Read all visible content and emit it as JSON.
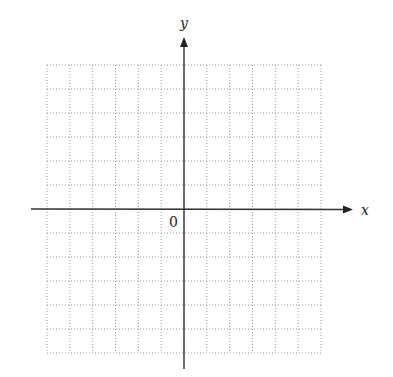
{
  "diagram": {
    "type": "coordinate-plane",
    "axes": {
      "x_label": "x",
      "y_label": "y",
      "origin_label": "0"
    },
    "grid": {
      "columns": 12,
      "rows": 12,
      "columns_left_of_y_axis": 6,
      "rows_above_x_axis": 6,
      "line_style": "dotted",
      "line_color": "#9a9a9a"
    },
    "axis_color": "#333333"
  }
}
